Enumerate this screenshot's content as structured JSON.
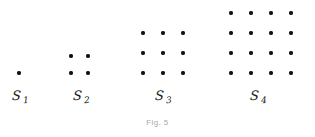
{
  "figure": {
    "caption": "Fig. 5",
    "background_color": "#ffffff",
    "dot_color": "#111111",
    "caption_color": "#a9a9a9",
    "label_color": "#1a1a1a"
  },
  "chart_data": {
    "type": "scatter",
    "title": "Fig. 5",
    "subtitle": "",
    "xlabel": "",
    "ylabel": "",
    "grid": false,
    "legend": "none",
    "categories": [
      "S1",
      "S2",
      "S3",
      "S4"
    ],
    "values": [
      1,
      4,
      9,
      16
    ],
    "series": [
      {
        "name": "dot count",
        "values": [
          1,
          4,
          9,
          16
        ]
      },
      {
        "name": "grid side",
        "values": [
          1,
          2,
          3,
          4
        ]
      }
    ],
    "groups": [
      {
        "id": "s1",
        "label_base": "S",
        "label_sub": "1",
        "rows": 1,
        "cols": 1,
        "count": 1,
        "dot_spacing_px": 17,
        "origin_x_px": 17,
        "baseline_y_px": 71,
        "label_x_px": 12,
        "label_y_px": 88
      },
      {
        "id": "s2",
        "label_base": "S",
        "label_sub": "2",
        "rows": 2,
        "cols": 2,
        "count": 4,
        "dot_spacing_px": 17,
        "origin_x_px": 69,
        "baseline_y_px": 71,
        "label_x_px": 73,
        "label_y_px": 88
      },
      {
        "id": "s3",
        "label_base": "S",
        "label_sub": "3",
        "rows": 3,
        "cols": 3,
        "count": 9,
        "dot_spacing_px": 20,
        "origin_x_px": 141,
        "baseline_y_px": 71,
        "label_x_px": 155,
        "label_y_px": 88
      },
      {
        "id": "s4",
        "label_base": "S",
        "label_sub": "4",
        "rows": 4,
        "cols": 4,
        "count": 16,
        "dot_spacing_px": 20,
        "origin_x_px": 229,
        "baseline_y_px": 71,
        "label_x_px": 250,
        "label_y_px": 88
      }
    ]
  }
}
